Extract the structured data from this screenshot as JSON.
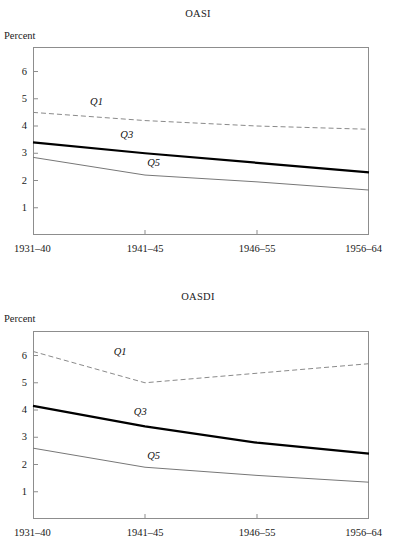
{
  "figure": {
    "y_axis_title": "Percent",
    "panels": [
      "OASI",
      "OASDI"
    ]
  },
  "chart_data": [
    {
      "type": "line",
      "title": "OASI",
      "xlabel": "",
      "ylabel": "Percent",
      "categories": [
        "1931–40",
        "1941–45",
        "1946–55",
        "1956–64"
      ],
      "yticks": [
        1,
        2,
        3,
        4,
        5,
        6
      ],
      "ylim": [
        0,
        6.9
      ],
      "grid": false,
      "legend": "inline-labels",
      "series": [
        {
          "name": "Q1",
          "style": "dashed",
          "color": "#8a8a8a",
          "width": 1,
          "values": [
            4.5,
            4.2,
            4.0,
            3.88
          ],
          "label": "Q1",
          "label_x": 0.17,
          "label_y": 4.85
        },
        {
          "name": "Q3",
          "style": "solid",
          "color": "#000000",
          "width": 2.2,
          "values": [
            3.4,
            3.0,
            2.65,
            2.3
          ],
          "label": "Q3",
          "label_x": 0.26,
          "label_y": 3.62
        },
        {
          "name": "Q5",
          "style": "solid",
          "color": "#777777",
          "width": 1,
          "values": [
            2.85,
            2.2,
            1.95,
            1.65
          ],
          "label": "Q5",
          "label_x": 0.34,
          "label_y": 2.62
        }
      ]
    },
    {
      "type": "line",
      "title": "OASDI",
      "xlabel": "",
      "ylabel": "Percent",
      "categories": [
        "1931–40",
        "1941–45",
        "1946–55",
        "1956–64"
      ],
      "yticks": [
        1,
        2,
        3,
        4,
        5,
        6
      ],
      "ylim": [
        0,
        6.9
      ],
      "grid": false,
      "legend": "inline-labels",
      "series": [
        {
          "name": "Q1",
          "style": "dashed",
          "color": "#8a8a8a",
          "width": 1,
          "values": [
            6.15,
            5.0,
            5.35,
            5.7
          ],
          "label": "Q1",
          "label_x": 0.24,
          "label_y": 6.1
        },
        {
          "name": "Q3",
          "style": "solid",
          "color": "#000000",
          "width": 2.2,
          "values": [
            4.15,
            3.4,
            2.8,
            2.4
          ],
          "label": "Q3",
          "label_x": 0.3,
          "label_y": 3.88
        },
        {
          "name": "Q5",
          "style": "solid",
          "color": "#777777",
          "width": 1,
          "values": [
            2.6,
            1.9,
            1.6,
            1.35
          ],
          "label": "Q5",
          "label_x": 0.34,
          "label_y": 2.28
        }
      ]
    }
  ]
}
